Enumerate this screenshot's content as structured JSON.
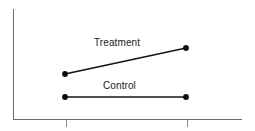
{
  "figure": {
    "background_color": "#ffffff",
    "axis_color": "#6b6b6b",
    "line_color": "#141414",
    "marker_color": "#0d0d0d",
    "width": 255,
    "height": 131
  },
  "labels": {
    "treatment": "Treatment",
    "control": "Control"
  },
  "chart_data": {
    "type": "line",
    "title": "",
    "subtitle": "",
    "xlabel": "",
    "ylabel": "",
    "x": [
      1,
      2
    ],
    "xtick_labels": [
      "",
      ""
    ],
    "ytick_labels": [],
    "xlim": [
      0.56,
      2.46
    ],
    "ylim": [
      0,
      1
    ],
    "grid": false,
    "legend": "inline-labels",
    "legend_position": "inline-above-each-series",
    "annotations": [
      {
        "text": "Treatment",
        "x": 1.5,
        "y": 0.74,
        "series": "Treatment"
      },
      {
        "text": "Control",
        "x": 1.5,
        "y": 0.355,
        "series": "Control"
      }
    ],
    "series": [
      {
        "name": "Treatment",
        "values": [
          0.41,
          0.645
        ],
        "marker": "filled-circle",
        "color": "#141414",
        "pixel_points": [
          [
            65,
            74
          ],
          [
            186,
            48
          ]
        ]
      },
      {
        "name": "Control",
        "values": [
          0.2,
          0.2
        ],
        "marker": "filled-circle",
        "color": "#141414",
        "pixel_points": [
          [
            65,
            97
          ],
          [
            186,
            97
          ]
        ]
      }
    ]
  },
  "axes": {
    "y_axis": {
      "x": 13,
      "y_top": 9,
      "y_bottom": 119
    },
    "x_axis": {
      "y": 119,
      "x_left": 13,
      "x_right": 242
    },
    "x_ticks": [
      {
        "x": 66,
        "label": ""
      },
      {
        "x": 187,
        "label": ""
      }
    ]
  }
}
